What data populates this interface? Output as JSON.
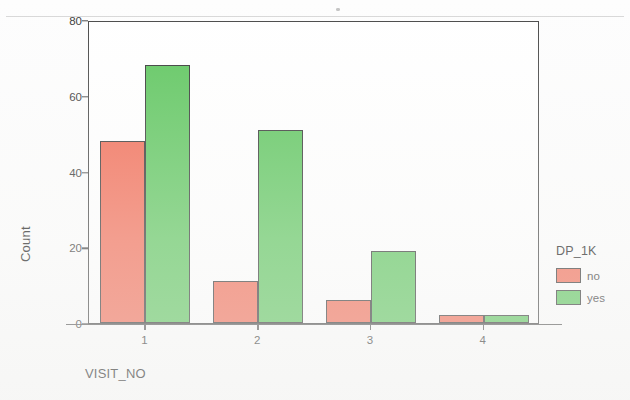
{
  "chart_data": {
    "type": "bar",
    "title": "",
    "subtitle": "",
    "xlabel": "VISIT_NO",
    "ylabel": "Count",
    "categories": [
      "1",
      "2",
      "3",
      "4"
    ],
    "series": [
      {
        "name": "no",
        "values": [
          48,
          11,
          6,
          2
        ],
        "color": "#f2705a"
      },
      {
        "name": "yes",
        "values": [
          68,
          51,
          19,
          2
        ],
        "color": "#62c762"
      }
    ],
    "legend": {
      "title": "DP_1K",
      "position": "right",
      "entries": [
        {
          "label": "no",
          "color": "#f2705a"
        },
        {
          "label": "yes",
          "color": "#62c762"
        }
      ]
    },
    "ylim": [
      0,
      80
    ],
    "yticks": [
      0,
      20,
      40,
      60,
      80
    ],
    "ytick_labels": [
      "0",
      "20",
      "40",
      "60",
      "80"
    ],
    "xtick_labels": [
      "1",
      "2",
      "3",
      "4"
    ],
    "grid": false,
    "bar_mode": "grouped"
  },
  "axes": {
    "y_title": "Count",
    "x_title": "VISIT_NO"
  },
  "legend": {
    "title": "DP_1K",
    "item_no": "no",
    "item_yes": "yes"
  }
}
